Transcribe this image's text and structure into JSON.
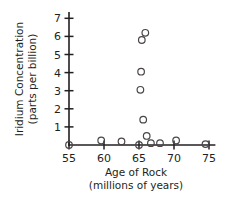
{
  "chart_data": {
    "type": "scatter",
    "title": "",
    "xlabel": "Age of Rock (millions of years)",
    "ylabel": "Iridium Concentration (parts per billion)",
    "xlim": [
      55,
      75.8
    ],
    "ylim": [
      0,
      7.3
    ],
    "xticks": [
      55,
      60,
      65,
      70,
      75
    ],
    "yticks": [
      1,
      2,
      3,
      4,
      5,
      6,
      7
    ],
    "grid": false,
    "legend": "none",
    "marker": "open-circle",
    "x": [
      55.0,
      59.6,
      62.5,
      65.0,
      65.2,
      65.3,
      65.4,
      65.6,
      65.9,
      66.1,
      66.7,
      68.0,
      70.3,
      74.5
    ],
    "y": [
      0.0,
      0.25,
      0.2,
      0.0,
      3.05,
      4.05,
      5.8,
      1.4,
      6.2,
      0.5,
      0.1,
      0.1,
      0.25,
      0.05
    ],
    "points": [
      {
        "x": 55.0,
        "y": 0.0
      },
      {
        "x": 59.6,
        "y": 0.25
      },
      {
        "x": 62.5,
        "y": 0.2
      },
      {
        "x": 65.0,
        "y": 0.0
      },
      {
        "x": 65.2,
        "y": 3.05
      },
      {
        "x": 65.3,
        "y": 4.05
      },
      {
        "x": 65.4,
        "y": 5.8
      },
      {
        "x": 65.6,
        "y": 1.4
      },
      {
        "x": 65.9,
        "y": 6.2
      },
      {
        "x": 66.1,
        "y": 0.5
      },
      {
        "x": 66.7,
        "y": 0.1
      },
      {
        "x": 68.0,
        "y": 0.1
      },
      {
        "x": 70.3,
        "y": 0.25
      },
      {
        "x": 74.5,
        "y": 0.05
      }
    ]
  },
  "axes": {
    "x_title_line1": "Age of Rock",
    "x_title_line2": "(millions of years)",
    "y_title_line1": "Iridium Concentration",
    "y_title_line2": "(parts per billion)",
    "x_tick_labels": [
      "55",
      "60",
      "65",
      "70",
      "75"
    ],
    "y_tick_labels": [
      "1",
      "2",
      "3",
      "4",
      "5",
      "6",
      "7"
    ]
  },
  "colors": {
    "axis": "#231f20",
    "marker_stroke": "#4a4648",
    "background": "#ffffff"
  }
}
